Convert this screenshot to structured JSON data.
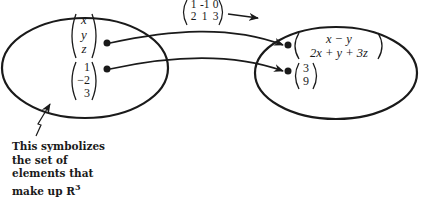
{
  "diagram": {
    "matrix": {
      "rows": [
        [
          "1",
          "-1",
          "0"
        ],
        [
          "2",
          "1",
          "3"
        ]
      ]
    },
    "domain_set": {
      "label": "R3",
      "elements": [
        {
          "name": "general-vector",
          "entries": [
            "x",
            "y",
            "z"
          ]
        },
        {
          "name": "specific-vector",
          "entries": [
            "1",
            "−2",
            "3"
          ]
        }
      ]
    },
    "codomain_set": {
      "elements": [
        {
          "name": "general-image",
          "entries": [
            "x − y",
            "2x + y + 3z"
          ]
        },
        {
          "name": "specific-image",
          "entries": [
            "3",
            "9"
          ]
        }
      ]
    },
    "caption": {
      "lines": [
        "This symbolizes",
        "the set of",
        "elements that",
        "make up R"
      ],
      "superscript": "3"
    }
  }
}
